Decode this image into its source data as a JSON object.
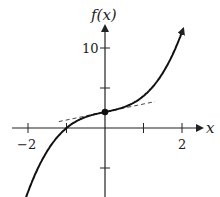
{
  "chart_data": {
    "type": "line",
    "title": "",
    "xlabel": "x",
    "ylabel": "f(x)",
    "x_ticks": [
      -2,
      -1,
      0,
      1,
      2
    ],
    "x_tick_labels": [
      "−2",
      "2"
    ],
    "y_ticks": [
      -5,
      5,
      10
    ],
    "y_tick_labels": [
      "10"
    ],
    "xlim": [
      -2.5,
      2.5
    ],
    "ylim": [
      -8.5,
      13
    ],
    "series": [
      {
        "name": "f(x)",
        "function": "x^3 + x + 2",
        "x": [
          -2.1,
          -1.5,
          -1,
          -0.5,
          0,
          0.5,
          1,
          1.5,
          2.05
        ],
        "y": [
          -9.36,
          -2.875,
          0,
          1.375,
          2,
          2.625,
          4,
          6.875,
          12.66
        ]
      }
    ],
    "points": [
      {
        "x": 0,
        "y": 2,
        "label": "(0, f(0))"
      }
    ],
    "tangent_line": {
      "at_x": 0,
      "slope": 1,
      "style": "dashed",
      "x_range": [
        -1.2,
        1.3
      ]
    },
    "grid": false,
    "legend": null
  }
}
